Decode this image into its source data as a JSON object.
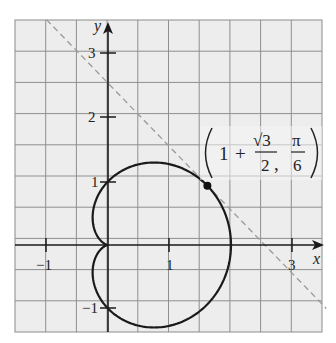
{
  "chart_data": {
    "type": "line",
    "title": "",
    "xlabel": "x",
    "ylabel": "y",
    "xlim": [
      -1.5,
      3.5
    ],
    "ylim": [
      -1.4,
      3.6
    ],
    "grid": true,
    "grid_step": 0.5,
    "x_ticks": [
      -1,
      1,
      3
    ],
    "x_tick_labels": [
      "−1",
      "1",
      "3"
    ],
    "y_ticks": [
      -1,
      1,
      2,
      3
    ],
    "y_tick_labels": [
      "−1",
      "1",
      "2",
      "3"
    ],
    "series": [
      {
        "name": "cardioid r = 1 + cos θ",
        "kind": "polar_curve",
        "equation": "r = 1 + cos(theta)",
        "color": "#1a1a1a",
        "style": "solid"
      },
      {
        "name": "tangent line",
        "kind": "line",
        "equation": "y = -x + 2.549",
        "points": [
          [
            -1.0,
            3.549
          ],
          [
            3.55,
            -1.0
          ]
        ],
        "color": "#999999",
        "style": "dashed"
      }
    ],
    "highlighted_point": {
      "polar": [
        1.866,
        0.5236
      ],
      "cartesian": [
        1.616,
        0.933
      ],
      "label_parts": {
        "whole": "1",
        "plus": "+",
        "sqrt_num": "√3",
        "den": "2",
        "comma": ",",
        "pi_num": "π",
        "pi_den": "6"
      }
    }
  },
  "axes": {
    "x_label": "x",
    "y_label": "y",
    "x_ticks": {
      "neg1": "−1",
      "one": "1",
      "three": "3"
    },
    "y_ticks": {
      "three": "3",
      "two": "2",
      "one": "1",
      "neg1": "−1"
    }
  },
  "annotation": {
    "whole": "1",
    "plus": "+",
    "sqrt_num": "√3",
    "den": "2",
    "comma": ",",
    "pi_num": "π",
    "pi_den": "6"
  },
  "colors": {
    "grid_bg": "#ececec",
    "grid_line": "#8c8c8c",
    "axis": "#1a1a1a",
    "curve": "#1a1a1a",
    "tangent": "#9a9a9a"
  }
}
